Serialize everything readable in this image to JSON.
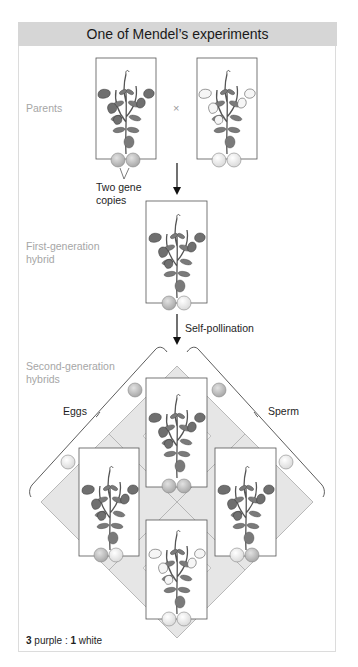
{
  "header": {
    "title": "One of Mendel’s experiments"
  },
  "labels": {
    "parents": "Parents",
    "cross_symbol": "×",
    "gene_copies_line1": "Two gene",
    "gene_copies_line2": "copies",
    "first_gen_line1": "First-generation",
    "first_gen_line2": "hybrid",
    "self_pollination": "Self-pollination",
    "second_gen_line1": "Second-generation",
    "second_gen_line2": "hybrids",
    "eggs": "Eggs",
    "sperm": "Sperm"
  },
  "ratio": {
    "purple_count": "3",
    "purple_label": " purple : ",
    "white_count": "1",
    "white_label": " white"
  },
  "colors": {
    "header_bg": "#d6d6d6",
    "purple_allele": "#b8b8b8",
    "white_allele": "#ebebeb",
    "punnett_fill": "#e6e6e6",
    "flower_purple": "#6f6f6f",
    "flower_white": "#f4f4f4",
    "leaf": "#7a7a7a"
  },
  "plants": [
    {
      "id": "parent-purple",
      "flowers": "purple",
      "alleles": [
        "purple",
        "purple"
      ]
    },
    {
      "id": "parent-white",
      "flowers": "white",
      "alleles": [
        "white",
        "white"
      ]
    },
    {
      "id": "f1-hybrid",
      "flowers": "purple",
      "alleles": [
        "purple",
        "white"
      ]
    },
    {
      "id": "f2-top",
      "flowers": "purple",
      "alleles": [
        "purple",
        "purple"
      ]
    },
    {
      "id": "f2-left",
      "flowers": "purple",
      "alleles": [
        "purple",
        "white"
      ]
    },
    {
      "id": "f2-right",
      "flowers": "purple",
      "alleles": [
        "white",
        "purple"
      ]
    },
    {
      "id": "f2-bottom",
      "flowers": "white",
      "alleles": [
        "white",
        "white"
      ]
    }
  ]
}
